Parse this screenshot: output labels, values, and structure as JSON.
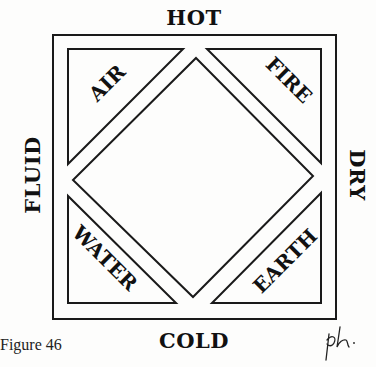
{
  "figure": {
    "caption": "Figure 46",
    "signature": "ph"
  },
  "qualities": {
    "top": "HOT",
    "bottom": "COLD",
    "left": "FLUID",
    "right": "DRY"
  },
  "elements": {
    "top_left": "AIR",
    "top_right": "FIRE",
    "bottom_left": "WATER",
    "bottom_right": "EARTH"
  },
  "colors": {
    "ink": "#1a1a1a",
    "paper": "#fdfdfc"
  }
}
